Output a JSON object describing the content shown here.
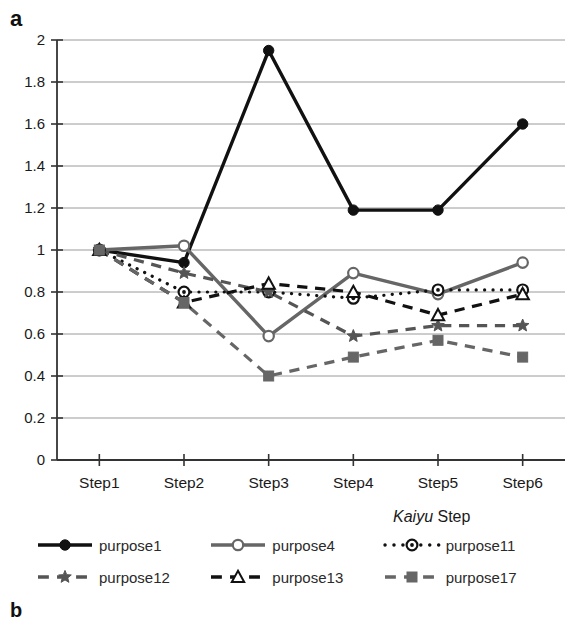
{
  "panel": {
    "label_a": "a",
    "label_b": "b"
  },
  "axis": {
    "x_title_italic": "Kaiyu",
    "x_title_rest": " Step",
    "y_ticks": [
      "0",
      "0.2",
      "0.4",
      "0.6",
      "0.8",
      "1",
      "1.2",
      "1.4",
      "1.6",
      "1.8",
      "2"
    ]
  },
  "legend": {
    "entries": [
      {
        "label": "purpose1",
        "marker": "filled-circle",
        "line": "solid",
        "color": "#111111"
      },
      {
        "label": "purpose4",
        "marker": "open-circle",
        "line": "solid",
        "color": "#666666"
      },
      {
        "label": "purpose11",
        "marker": "circle-dot",
        "line": "dotted",
        "color": "#111111"
      },
      {
        "label": "purpose12",
        "marker": "star",
        "line": "dashed",
        "color": "#555555"
      },
      {
        "label": "purpose13",
        "marker": "open-triangle",
        "line": "dashed",
        "color": "#111111"
      },
      {
        "label": "purpose17",
        "marker": "filled-square",
        "line": "dashed",
        "color": "#666666"
      }
    ]
  },
  "chart_data": {
    "type": "line",
    "title": "",
    "xlabel": "Kaiyu Step",
    "ylabel": "",
    "categories": [
      "Step1",
      "Step2",
      "Step3",
      "Step4",
      "Step5",
      "Step6"
    ],
    "ylim": [
      0,
      2
    ],
    "ytick_step": 0.2,
    "grid": "horizontal",
    "legend_position": "bottom",
    "series": [
      {
        "name": "purpose1",
        "values": [
          1.0,
          0.94,
          1.95,
          1.19,
          1.19,
          1.6
        ],
        "marker": "filled-circle",
        "line": "solid",
        "color": "#111111"
      },
      {
        "name": "purpose4",
        "values": [
          1.0,
          1.02,
          0.59,
          0.89,
          0.79,
          0.94
        ],
        "marker": "open-circle",
        "line": "solid",
        "color": "#666666"
      },
      {
        "name": "purpose11",
        "values": [
          1.0,
          0.8,
          0.8,
          0.77,
          0.81,
          0.81
        ],
        "marker": "circle-dot",
        "line": "dotted",
        "color": "#111111"
      },
      {
        "name": "purpose12",
        "values": [
          1.0,
          0.89,
          0.8,
          0.59,
          0.64,
          0.64
        ],
        "marker": "star",
        "line": "dashed",
        "color": "#555555"
      },
      {
        "name": "purpose13",
        "values": [
          1.0,
          0.75,
          0.84,
          0.8,
          0.69,
          0.79
        ],
        "marker": "open-triangle",
        "line": "dashed",
        "color": "#111111"
      },
      {
        "name": "purpose17",
        "values": [
          1.0,
          0.75,
          0.4,
          0.49,
          0.57,
          0.49
        ],
        "marker": "filled-square",
        "line": "dashed",
        "color": "#666666"
      }
    ]
  }
}
